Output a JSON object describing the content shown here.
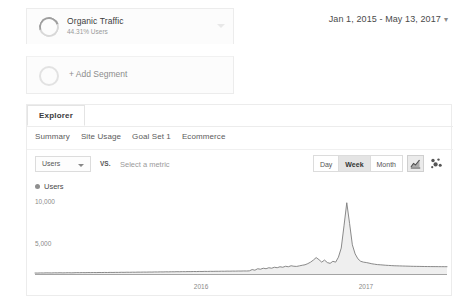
{
  "segments": {
    "applied": {
      "name": "Organic Traffic",
      "sub": "44.31% Users",
      "donut_icon": "donut-progress-icon",
      "caret_icon": "chevron-down-icon"
    },
    "add": {
      "label": "+ Add Segment",
      "circle_icon": "empty-circle-icon"
    }
  },
  "date_range": {
    "label": "Jan 1, 2015 - May 13, 2017",
    "caret": "▾"
  },
  "explorer": {
    "tab_label": "Explorer",
    "subnav": [
      {
        "label": "Summary"
      },
      {
        "label": "Site Usage"
      },
      {
        "label": "Goal Set 1"
      },
      {
        "label": "Ecommerce"
      }
    ]
  },
  "metric_row": {
    "primary_metric": "Users",
    "vs_label": "VS.",
    "secondary_placeholder": "Select a metric",
    "granularity": [
      {
        "label": "Day",
        "active": false
      },
      {
        "label": "Week",
        "active": true
      },
      {
        "label": "Month",
        "active": false
      }
    ],
    "chart_type_buttons": [
      {
        "icon": "line-chart-icon",
        "active": true
      },
      {
        "icon": "motion-chart-icon",
        "active": false
      }
    ]
  },
  "chart_data": {
    "type": "area",
    "title": "",
    "xlabel": "",
    "ylabel": "",
    "legend": [
      "Users"
    ],
    "legend_position": "top-left",
    "grid": false,
    "ylim": [
      0,
      10000
    ],
    "ytick_labels": [
      "10,000",
      "5,000"
    ],
    "ytick_values": [
      10000,
      5000
    ],
    "xtick_labels": [
      "2016",
      "2017"
    ],
    "xtick_values": [
      2016,
      2017
    ],
    "series": [
      {
        "name": "Users",
        "color": "#808080",
        "fill": "#f0f0f0",
        "values": [
          180,
          175,
          190,
          185,
          200,
          195,
          188,
          205,
          198,
          210,
          195,
          205,
          215,
          200,
          212,
          225,
          218,
          230,
          222,
          235,
          228,
          240,
          232,
          245,
          238,
          250,
          242,
          255,
          248,
          260,
          255,
          268,
          262,
          275,
          268,
          280,
          275,
          288,
          282,
          295,
          290,
          300,
          295,
          310,
          305,
          318,
          312,
          325,
          320,
          332,
          328,
          340,
          335,
          348,
          342,
          355,
          350,
          362,
          358,
          370,
          365,
          378,
          372,
          385,
          380,
          392,
          388,
          400,
          395,
          408,
          402,
          415,
          410,
          422,
          418,
          430,
          425,
          440,
          600,
          520,
          700,
          640,
          760,
          700,
          820,
          760,
          880,
          820,
          940,
          880,
          1000,
          940,
          1060,
          1000,
          980,
          1050,
          1120,
          1180,
          1320,
          1500,
          1750,
          2050,
          1800,
          1500,
          1750,
          1450,
          1350,
          1600,
          1500,
          2100,
          3200,
          5900,
          8700,
          6200,
          3600,
          2500,
          1900,
          1600,
          1500,
          1450,
          1380,
          1300,
          1250,
          1200,
          1180,
          1150,
          1120,
          1100,
          1080,
          1060,
          1050,
          1040,
          1030,
          1020,
          1010,
          1000,
          990,
          985,
          980,
          975,
          970,
          965,
          960,
          958,
          955,
          952,
          950,
          948,
          945
        ]
      }
    ]
  }
}
